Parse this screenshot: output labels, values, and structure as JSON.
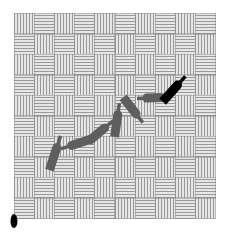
{
  "board": {
    "rows": 10,
    "cols": 10,
    "origin": [
      14,
      13
    ],
    "size": [
      201,
      205
    ],
    "pattern_first_cell": "vertical",
    "colors": {
      "line": "#9a9a9a",
      "gap": "#e6e6e6"
    }
  },
  "bottles": [
    {
      "id": "bottle-1",
      "cx": 55,
      "cy": 153,
      "length": 36,
      "angle": -72,
      "color": "#5e5e5e"
    },
    {
      "id": "bottle-2",
      "cx": 76,
      "cy": 144,
      "length": 32,
      "angle": 162,
      "color": "#5e5e5e"
    },
    {
      "id": "bottle-3",
      "cx": 101,
      "cy": 131,
      "length": 32,
      "angle": -40,
      "color": "#5e5e5e"
    },
    {
      "id": "bottle-4",
      "cx": 117,
      "cy": 120,
      "length": 34,
      "angle": -82,
      "color": "#5e5e5e"
    },
    {
      "id": "bottle-5",
      "cx": 133,
      "cy": 110,
      "length": 32,
      "angle": 52,
      "color": "#5e5e5e"
    },
    {
      "id": "bottle-6",
      "cx": 150,
      "cy": 98,
      "length": 26,
      "angle": 178,
      "color": "#5e5e5e"
    },
    {
      "id": "bottle-7",
      "cx": 174,
      "cy": 89,
      "length": 34,
      "angle": -48,
      "color": "#000000"
    }
  ],
  "marker": {
    "cx": 14,
    "cy": 221,
    "rx": 3.5,
    "ry": 7,
    "color": "#000000"
  }
}
